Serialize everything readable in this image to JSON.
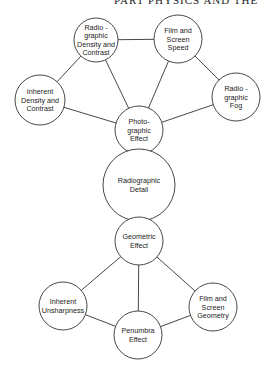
{
  "header": {
    "running_title": "PART  PHYSICS AND THE"
  },
  "diagram": {
    "nodes": [
      {
        "id": "rad_density",
        "lines": [
          "Radio -",
          "graphic",
          "Density and",
          "Contrast"
        ],
        "cx": 96,
        "cy": 40,
        "r": 22
      },
      {
        "id": "film_speed",
        "lines": [
          "Film and",
          "Screen",
          "Speed"
        ],
        "cx": 178,
        "cy": 39,
        "r": 24
      },
      {
        "id": "inherent_density",
        "lines": [
          "Inherent",
          "Density and",
          "Contrast"
        ],
        "cx": 40,
        "cy": 100,
        "r": 25
      },
      {
        "id": "rad_fog",
        "lines": [
          "Radio -",
          "graphic",
          "Fog"
        ],
        "cx": 236,
        "cy": 97,
        "r": 24
      },
      {
        "id": "photo_effect",
        "lines": [
          "Photo-",
          "graphic",
          "Effect"
        ],
        "cx": 139,
        "cy": 130,
        "r": 24
      },
      {
        "id": "rad_detail",
        "lines": [
          "Radiographic",
          "Detail"
        ],
        "cx": 139,
        "cy": 185,
        "r": 36
      },
      {
        "id": "geo_effect",
        "lines": [
          "Geometric",
          "Effect"
        ],
        "cx": 139,
        "cy": 241,
        "r": 24
      },
      {
        "id": "inherent_unsharp",
        "lines": [
          "Inherent",
          "Unsharpness"
        ],
        "cx": 63,
        "cy": 306,
        "r": 24
      },
      {
        "id": "film_geometry",
        "lines": [
          "Film and",
          "Screen",
          "Geometry"
        ],
        "cx": 213,
        "cy": 307,
        "r": 24
      },
      {
        "id": "penumbra",
        "lines": [
          "Penumbra",
          "Effect"
        ],
        "cx": 138,
        "cy": 335,
        "r": 24
      }
    ],
    "edges": [
      [
        "inherent_density",
        "rad_density"
      ],
      [
        "rad_density",
        "film_speed"
      ],
      [
        "film_speed",
        "rad_fog"
      ],
      [
        "inherent_density",
        "photo_effect"
      ],
      [
        "rad_density",
        "photo_effect"
      ],
      [
        "film_speed",
        "photo_effect"
      ],
      [
        "rad_fog",
        "photo_effect"
      ],
      [
        "geo_effect",
        "inherent_unsharp"
      ],
      [
        "geo_effect",
        "penumbra"
      ],
      [
        "geo_effect",
        "film_geometry"
      ],
      [
        "inherent_unsharp",
        "penumbra"
      ],
      [
        "penumbra",
        "film_geometry"
      ]
    ]
  }
}
